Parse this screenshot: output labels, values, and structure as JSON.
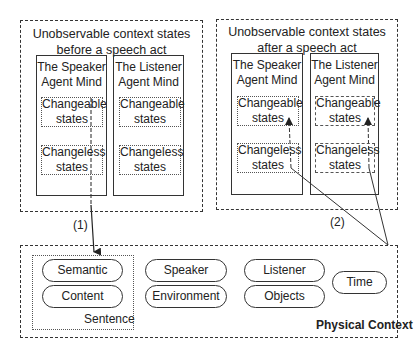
{
  "before": {
    "title_line1": "Unobservable context states",
    "title_line2": "before a speech act",
    "speaker": {
      "title_line1": "The Speaker",
      "title_line2": "Agent Mind",
      "changeable_1": "Changeable",
      "changeable_2": "states",
      "changeless_1": "Changeless",
      "changeless_2": "states"
    },
    "listener": {
      "title_line1": "The Listener",
      "title_line2": "Agent Mind",
      "changeable_1": "Changeable",
      "changeable_2": "states",
      "changeless_1": "Changeless",
      "changeless_2": "states"
    }
  },
  "after": {
    "title_line1": "Unobservable context states",
    "title_line2": "after a speech act",
    "speaker": {
      "title_line1": "The Speaker",
      "title_line2": "Agent Mind",
      "changeable_1": "Changeable",
      "changeable_2": "states",
      "changeless_1": "Changeless",
      "changeless_2": "states"
    },
    "listener": {
      "title_line1": "The Listener",
      "title_line2": "Agent Mind",
      "changeable_1": "Changeable",
      "changeable_2": "states",
      "changeless_1": "Changeless",
      "changeless_2": "states"
    }
  },
  "arrows": {
    "label_1": "(1)",
    "label_2": "(2)"
  },
  "physical": {
    "title": "Physical Context",
    "sentence_label": "Sentence",
    "items": [
      "Semantic",
      "Content",
      "Speaker",
      "Environment",
      "Listener",
      "Objects",
      "Time"
    ]
  }
}
